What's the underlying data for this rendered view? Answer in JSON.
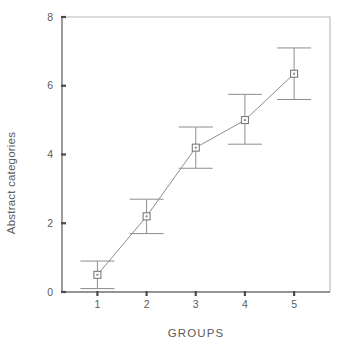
{
  "chart_data": {
    "type": "line",
    "title": "",
    "subtitle": "",
    "xlabel": "GROUPS",
    "ylabel": "Abstract categories",
    "categories": [
      "1",
      "2",
      "3",
      "4",
      "5"
    ],
    "x": [
      1,
      2,
      3,
      4,
      5
    ],
    "values": [
      0.5,
      2.2,
      4.2,
      5.0,
      6.35
    ],
    "error_low": [
      0.1,
      1.7,
      3.6,
      4.3,
      5.6
    ],
    "error_high": [
      0.9,
      2.7,
      4.8,
      5.75,
      7.1
    ],
    "series": [
      {
        "name": "Abstract categories",
        "values": [
          0.5,
          2.2,
          4.2,
          5.0,
          6.35
        ],
        "error_low": [
          0.1,
          1.7,
          3.6,
          4.3,
          5.6
        ],
        "error_high": [
          0.9,
          2.7,
          4.8,
          5.75,
          7.1
        ]
      }
    ],
    "ylim": [
      0,
      8
    ],
    "yticks": [
      0,
      2,
      4,
      6,
      8
    ],
    "ytick_labels": [
      "0",
      "2",
      "4",
      "6",
      "8"
    ],
    "xtick_labels": [
      "1",
      "2",
      "3",
      "4",
      "5"
    ],
    "grid": false,
    "legend": null,
    "legend_position": "none",
    "marker": "open-square",
    "error_bar_style": "capped-whisker",
    "colors": {
      "line": "#8e8e8e",
      "marker_edge": "#6e6e6e",
      "marker_fill": "#ffffff",
      "error_bar": "#8e8e8e",
      "axis": "#707070",
      "frame": "#b8b8b8",
      "text": "#5c5c5c",
      "background": "#ffffff"
    }
  },
  "axes": {
    "x_title": "GROUPS",
    "y_title": "Abstract categories"
  }
}
